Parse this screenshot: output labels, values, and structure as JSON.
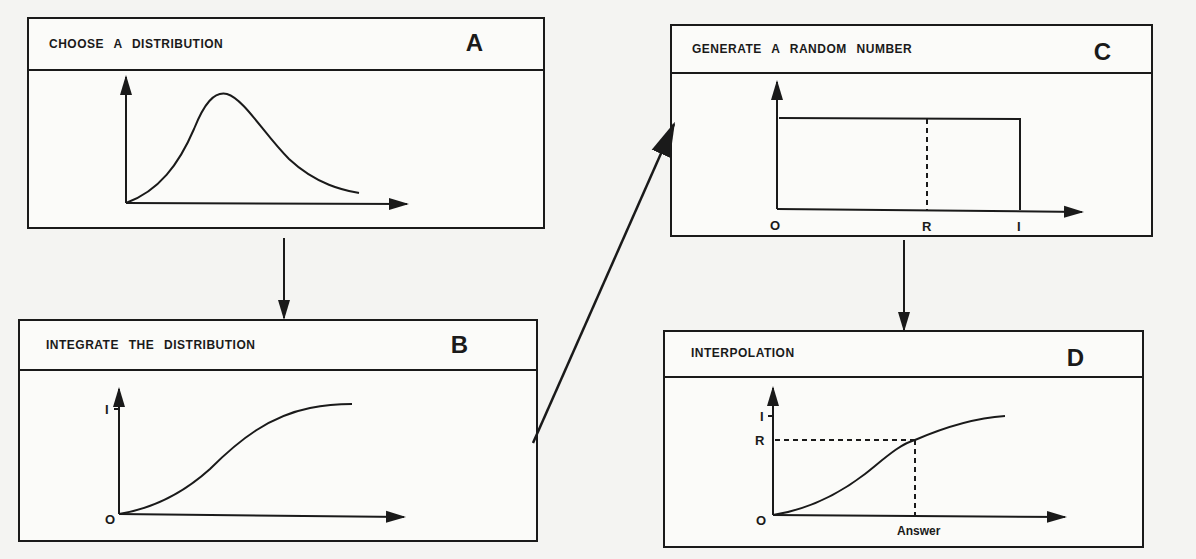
{
  "panels": {
    "A": {
      "title": "CHOOSE  A  DISTRIBUTION",
      "letter": "A"
    },
    "B": {
      "title": "INTEGRATE  THE  DISTRIBUTION",
      "letter": "B",
      "y_top_label": "I",
      "origin_label": "O"
    },
    "C": {
      "title": "GENERATE  A  RANDOM  NUMBER",
      "letter": "C",
      "x_labels": {
        "origin": "O",
        "r": "R",
        "one": "I"
      }
    },
    "D": {
      "title": "INTERPOLATION",
      "letter": "D",
      "y_top_label": "I",
      "r_label": "R",
      "origin_label": "O",
      "answer_label": "Answer"
    }
  },
  "flow": [
    {
      "from": "A",
      "to": "B"
    },
    {
      "from": "B",
      "to": "C"
    },
    {
      "from": "C",
      "to": "D"
    }
  ],
  "colors": {
    "ink": "#1a1a1a",
    "paper": "#fbfbf9",
    "background": "#f4f4f2"
  }
}
